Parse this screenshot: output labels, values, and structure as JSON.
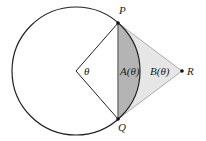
{
  "diagram": {
    "type": "geometry",
    "circle": {
      "cx": 76,
      "cy": 71,
      "r": 64
    },
    "points": {
      "center": {
        "x": 76,
        "y": 71
      },
      "P": {
        "x": 118,
        "y": 23,
        "label": "P"
      },
      "Q": {
        "x": 118,
        "y": 119,
        "label": "Q"
      },
      "R": {
        "x": 182,
        "y": 71,
        "label": "R"
      }
    },
    "labels": {
      "angle": "θ",
      "region_a": "A(θ)",
      "region_b": "B(θ)",
      "P": "P",
      "Q": "Q",
      "R": "R"
    },
    "colors": {
      "stroke": "#222222",
      "segment_fill": "#b4b4b4",
      "triangle_fill": "#e6e6e6",
      "triangle_stroke": "#9a9a9a"
    }
  }
}
